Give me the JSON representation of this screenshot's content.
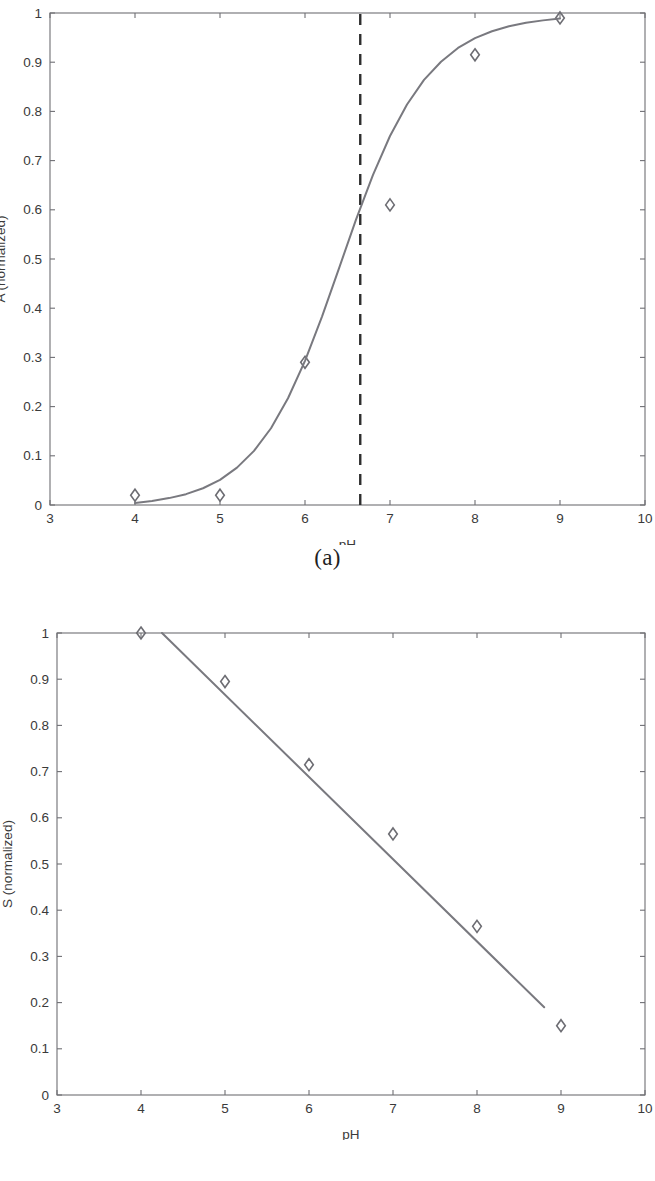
{
  "figure": {
    "panels": [
      {
        "id": "a",
        "caption": "(a)"
      },
      {
        "id": "b",
        "caption": "(b)"
      }
    ]
  },
  "chart_data": [
    {
      "type": "scatter",
      "panel": "a",
      "title": "",
      "xlabel": "pH",
      "ylabel": "A (normalized)",
      "xlim": [
        3,
        10
      ],
      "ylim": [
        0,
        1
      ],
      "xticks": [
        3,
        4,
        5,
        6,
        7,
        8,
        9,
        10
      ],
      "xtick_labels": [
        "3",
        "4",
        "5",
        "6",
        "7",
        "8",
        "9",
        "10"
      ],
      "yticks": [
        0,
        0.1,
        0.2,
        0.3,
        0.4,
        0.5,
        0.6,
        0.7,
        0.8,
        0.9,
        1
      ],
      "ytick_labels": [
        "0",
        "0.1",
        "0.2",
        "0.3",
        "0.4",
        "0.5",
        "0.6",
        "0.7",
        "0.8",
        "0.9",
        "1"
      ],
      "grid": false,
      "legend": "none",
      "series": [
        {
          "name": "measured",
          "marker": "diamond",
          "x": [
            4,
            5,
            6,
            7,
            8,
            9
          ],
          "values": [
            0.02,
            0.02,
            0.29,
            0.61,
            0.915,
            0.99
          ]
        },
        {
          "name": "sigmoid fit",
          "marker": "none",
          "x": [
            4.0,
            4.2,
            4.4,
            4.6,
            4.8,
            5.0,
            5.2,
            5.4,
            5.6,
            5.8,
            6.0,
            6.2,
            6.4,
            6.6,
            6.8,
            7.0,
            7.2,
            7.4,
            7.6,
            7.8,
            8.0,
            8.2,
            8.4,
            8.6,
            8.8,
            9.0
          ],
          "values": [
            0.004,
            0.008,
            0.014,
            0.022,
            0.034,
            0.051,
            0.076,
            0.11,
            0.156,
            0.217,
            0.293,
            0.383,
            0.481,
            0.58,
            0.671,
            0.75,
            0.814,
            0.864,
            0.901,
            0.929,
            0.949,
            0.963,
            0.973,
            0.98,
            0.985,
            0.989
          ]
        }
      ],
      "annotations": [
        {
          "type": "vertical-dashed-line",
          "name": "pka-reference-line",
          "x": 6.65,
          "y_from": 0,
          "y_to": 1
        }
      ]
    },
    {
      "type": "scatter",
      "panel": "b",
      "title": "",
      "xlabel": "pH",
      "ylabel": "S (normalized)",
      "xlim": [
        3,
        10
      ],
      "ylim": [
        0,
        1
      ],
      "xticks": [
        3,
        4,
        5,
        6,
        7,
        8,
        9,
        10
      ],
      "xtick_labels": [
        "3",
        "4",
        "5",
        "6",
        "7",
        "8",
        "9",
        "10"
      ],
      "yticks": [
        0,
        0.1,
        0.2,
        0.3,
        0.4,
        0.5,
        0.6,
        0.7,
        0.8,
        0.9,
        1
      ],
      "ytick_labels": [
        "0",
        "0.1",
        "0.2",
        "0.3",
        "0.4",
        "0.5",
        "0.6",
        "0.7",
        "0.8",
        "0.9",
        "1"
      ],
      "grid": false,
      "legend": "none",
      "series": [
        {
          "name": "measured",
          "marker": "diamond",
          "x": [
            4,
            5,
            6,
            7,
            8,
            9
          ],
          "values": [
            1.0,
            0.895,
            0.715,
            0.565,
            0.365,
            0.15
          ]
        },
        {
          "name": "linear fit",
          "marker": "none",
          "x": [
            4.25,
            8.8
          ],
          "values": [
            1.0,
            0.19
          ]
        }
      ],
      "annotations": []
    }
  ]
}
